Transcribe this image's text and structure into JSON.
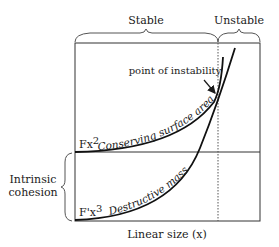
{
  "diagram": {
    "top_labels": {
      "stable": "Stable",
      "unstable": "Unstable"
    },
    "annotation": "point of instability",
    "curves": {
      "quadratic": {
        "label": "Conserving surface area",
        "axis_label": "Fx",
        "axis_exponent": "2"
      },
      "cubic": {
        "label": "Destructive mass",
        "axis_label": "F'x",
        "axis_exponent": "3"
      }
    },
    "left_label": {
      "line1": "Intrinsic",
      "line2": "cohesion"
    },
    "x_axis_label": "Linear size (x)"
  }
}
